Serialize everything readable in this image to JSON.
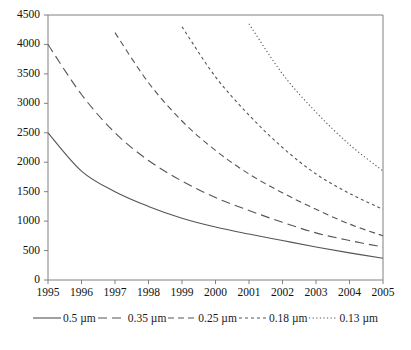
{
  "chart_data": {
    "type": "line",
    "title": "",
    "xlabel": "",
    "ylabel": "",
    "xlim": [
      1995,
      2005
    ],
    "ylim": [
      0,
      4500
    ],
    "grid": false,
    "legend_position": "bottom",
    "x_ticks": [
      "1995",
      "1996",
      "1997",
      "1998",
      "1999",
      "2000",
      "2001",
      "2002",
      "2003",
      "2004",
      "2005"
    ],
    "y_ticks": [
      "0",
      "500",
      "1000",
      "1500",
      "2000",
      "2500",
      "3000",
      "3500",
      "4000",
      "4500"
    ],
    "x": [
      1995,
      1996,
      1997,
      1998,
      1999,
      2000,
      2001,
      2002,
      2003,
      2004,
      2005
    ],
    "series": [
      {
        "name": "0.5 µm",
        "style": "solid",
        "color": "#555555",
        "x": [
          1995,
          1996,
          1997,
          1998,
          1999,
          2000,
          2001,
          2002,
          2003,
          2004,
          2005
        ],
        "values": [
          2500,
          1850,
          1500,
          1250,
          1050,
          900,
          780,
          670,
          560,
          460,
          370
        ]
      },
      {
        "name": "0.35 µm",
        "style": "long-dash",
        "color": "#555555",
        "x": [
          1995,
          1996,
          1997,
          1998,
          1999,
          2000,
          2001,
          2002,
          2003,
          2004,
          2005
        ],
        "values": [
          4000,
          3150,
          2500,
          2030,
          1680,
          1400,
          1180,
          980,
          800,
          670,
          560
        ]
      },
      {
        "name": "0.25 µm",
        "style": "dash",
        "color": "#555555",
        "x": [
          1997,
          1998,
          1999,
          2000,
          2001,
          2002,
          2003,
          2004,
          2005
        ],
        "values": [
          4200,
          3350,
          2700,
          2200,
          1800,
          1480,
          1200,
          950,
          750
        ]
      },
      {
        "name": "0.18 µm",
        "style": "short-dash",
        "color": "#555555",
        "x": [
          1999,
          2000,
          2001,
          2002,
          2003,
          2004,
          2005
        ],
        "values": [
          4300,
          3450,
          2800,
          2250,
          1800,
          1470,
          1200
        ]
      },
      {
        "name": "0.13 µm",
        "style": "dotted",
        "color": "#555555",
        "x": [
          2001,
          2002,
          2003,
          2004,
          2005
        ],
        "values": [
          4350,
          3500,
          2850,
          2300,
          1850
        ]
      }
    ]
  },
  "legend": {
    "items": [
      {
        "label": "0.5 µm",
        "style": "solid"
      },
      {
        "label": "0.35 µm",
        "style": "long-dash"
      },
      {
        "label": "0.25 µm",
        "style": "dash"
      },
      {
        "label": "0.18 µm",
        "style": "short-dash"
      },
      {
        "label": "0.13 µm",
        "style": "dotted"
      }
    ]
  },
  "axis": {
    "line_color": "#808080"
  }
}
